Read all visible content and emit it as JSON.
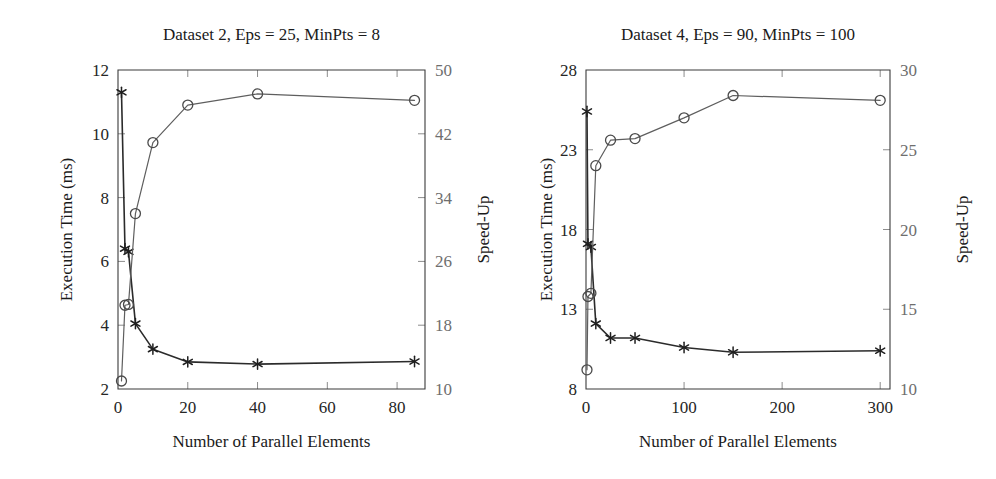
{
  "figure": {
    "background": "#ffffff",
    "ink_color": "#2b2b2b",
    "accent_speedup_color": "#5e5e5e",
    "accent_time_color": "#1f1f1f",
    "axis_color": "#3b3b3b",
    "right_tick_label_color": "#6e6e6e"
  },
  "chart_data": [
    {
      "type": "line",
      "id": "dataset-2",
      "title": "Dataset 2, Eps = 25, MinPts = 8",
      "xlabel": "Number of Parallel Elements",
      "ylabel": "Execution Time (ms)",
      "y2label": "Speed-Up",
      "xlim": [
        0,
        88
      ],
      "ylim": [
        2,
        12
      ],
      "y2lim": [
        10,
        50
      ],
      "xticks": [
        0,
        20,
        40,
        60,
        80
      ],
      "xticklabels": [
        "0",
        "20",
        "40",
        "60",
        "80"
      ],
      "yticks": [
        2,
        4,
        6,
        8,
        10,
        12
      ],
      "yticklabels": [
        "2",
        "4",
        "6",
        "8",
        "10",
        "12"
      ],
      "y2ticks": [
        10,
        18,
        26,
        34,
        42,
        50
      ],
      "y2ticklabels": [
        "10",
        "18",
        "26",
        "34",
        "42",
        "50"
      ],
      "grid": false,
      "legend": "none",
      "series": [
        {
          "name": "Execution Time (ms)",
          "axis": "left",
          "marker": "star",
          "x": [
            1,
            2,
            3,
            5,
            10,
            20,
            40,
            85
          ],
          "values": [
            11.3,
            6.4,
            6.3,
            4.05,
            3.25,
            2.85,
            2.78,
            2.86
          ]
        },
        {
          "name": "Speed-Up",
          "axis": "right",
          "marker": "circle",
          "x": [
            1,
            2,
            3,
            5,
            10,
            20,
            40,
            85
          ],
          "values": [
            11.0,
            20.5,
            20.6,
            32.0,
            40.9,
            45.6,
            47.0,
            46.2
          ]
        }
      ]
    },
    {
      "type": "line",
      "id": "dataset-4",
      "title": "Dataset 4, Eps = 90, MinPts = 100",
      "xlabel": "Number of Parallel Elements",
      "ylabel": "Execution Time (ms)",
      "y2label": "Speed-Up",
      "xlim": [
        0,
        310
      ],
      "ylim": [
        8,
        28
      ],
      "y2lim": [
        10,
        30
      ],
      "xticks": [
        0,
        100,
        200,
        300
      ],
      "xticklabels": [
        "0",
        "100",
        "200",
        "300"
      ],
      "yticks": [
        8,
        13,
        18,
        23,
        28
      ],
      "yticklabels": [
        "8",
        "13",
        "18",
        "23",
        "28"
      ],
      "y2ticks": [
        10,
        15,
        20,
        25,
        30
      ],
      "y2ticklabels": [
        "10",
        "15",
        "20",
        "25",
        "30"
      ],
      "grid": false,
      "legend": "none",
      "series": [
        {
          "name": "Execution Time (ms)",
          "axis": "left",
          "marker": "star",
          "x": [
            1,
            2,
            5,
            10,
            25,
            50,
            100,
            150,
            300
          ],
          "values": [
            25.4,
            17.1,
            16.9,
            12.1,
            11.2,
            11.2,
            10.6,
            10.3,
            10.4
          ]
        },
        {
          "name": "Speed-Up",
          "axis": "right",
          "marker": "circle",
          "x": [
            1,
            2,
            5,
            10,
            25,
            50,
            100,
            150,
            300
          ],
          "values": [
            11.2,
            15.8,
            16.0,
            24.0,
            25.6,
            25.7,
            27.0,
            28.4,
            28.1
          ]
        }
      ]
    }
  ]
}
